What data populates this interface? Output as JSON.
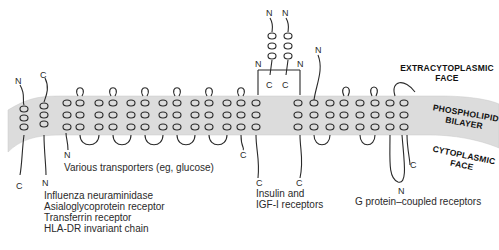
{
  "figure": {
    "regions": {
      "extracytoplasmic": "EXTRACYTOPLASMIC\nFACE",
      "extracytoplasmic_l1": "EXTRACYTOPLASMIC",
      "extracytoplasmic_l2": "FACE",
      "bilayer_l1": "PHOSPHOLIPID",
      "bilayer_l2": "BILAYER",
      "cytoplasmic_l1": "CYTOPLASMIC",
      "cytoplasmic_l2": "FACE"
    },
    "proteins": [
      {
        "id": "type-ii",
        "termini": {
          "top": "N",
          "bottom": "C"
        }
      },
      {
        "id": "type-i",
        "termini": {
          "top": "C",
          "bottom": "N"
        },
        "examples": [
          "Influenza neuraminidase",
          "Asialoglycoprotein receptor",
          "Transferrin receptor",
          "HLA-DR invariant chain"
        ]
      },
      {
        "id": "transporters",
        "termini": {
          "start": "N",
          "end": "C"
        },
        "label": "Various transporters (eg, glucose)"
      },
      {
        "id": "insulin",
        "termini": {
          "top1": "N",
          "top2": "N",
          "top3": "N",
          "top4": "N",
          "mid1": "C",
          "mid2": "C",
          "bottom1": "C",
          "bottom2": "C"
        },
        "label_l1": "Insulin and",
        "label_l2": "IGF-I receptors"
      },
      {
        "id": "gpcr",
        "termini": {
          "start": "N",
          "bottom": "N",
          "end": "C"
        },
        "label": "G protein–coupled receptors"
      }
    ],
    "colors": {
      "membrane": "#d9d9d9",
      "line": "#2a2a2a",
      "text": "#2a2a2a"
    }
  }
}
